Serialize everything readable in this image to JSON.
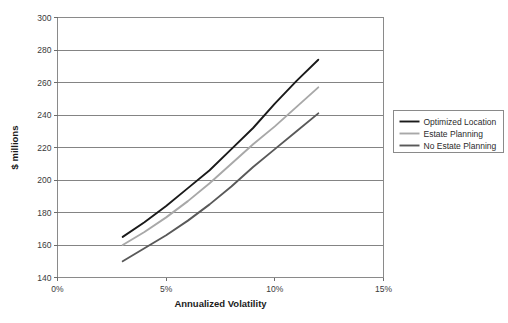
{
  "chart_data": {
    "type": "line",
    "title": "",
    "xlabel": "Annualized Volatility",
    "ylabel": "$ millions",
    "xlim": [
      0,
      15
    ],
    "ylim": [
      140,
      300
    ],
    "xtick_labels": [
      "0%",
      "5%",
      "10%",
      "15%"
    ],
    "xtick_values": [
      0,
      5,
      10,
      15
    ],
    "ytick_labels": [
      "140",
      "160",
      "180",
      "200",
      "220",
      "240",
      "260",
      "280",
      "300"
    ],
    "ytick_values": [
      140,
      160,
      180,
      200,
      220,
      240,
      260,
      280,
      300
    ],
    "grid": "horizontal",
    "legend_position": "right",
    "series": [
      {
        "name": "Optimized Location",
        "color": "#1a1a1a",
        "width": 1.9,
        "x": [
          3.0,
          4.0,
          5.0,
          6.0,
          7.0,
          8.0,
          9.0,
          10.0,
          11.0,
          12.0
        ],
        "values": [
          165,
          174,
          184,
          195,
          206,
          219,
          232,
          247,
          261,
          274
        ]
      },
      {
        "name": "Estate Planning",
        "color": "#a8a8a8",
        "width": 1.9,
        "x": [
          3.0,
          4.0,
          5.0,
          6.0,
          7.0,
          8.0,
          9.0,
          10.0,
          11.0,
          12.0
        ],
        "values": [
          160,
          168,
          177,
          187,
          198,
          210,
          222,
          233,
          245,
          257
        ]
      },
      {
        "name": "No Estate Planning",
        "color": "#595959",
        "width": 1.9,
        "x": [
          3.0,
          4.0,
          5.0,
          6.0,
          7.0,
          8.0,
          9.0,
          10.0,
          11.0,
          12.0
        ],
        "values": [
          150,
          158,
          166,
          175,
          185,
          196,
          208,
          219,
          230,
          241
        ]
      }
    ]
  }
}
